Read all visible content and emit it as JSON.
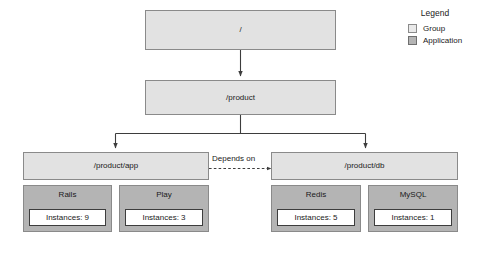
{
  "diagram": {
    "nodes": {
      "root": {
        "label": "/",
        "kind": "Group"
      },
      "product": {
        "label": "/product",
        "kind": "Group"
      },
      "product_app": {
        "label": "/product/app",
        "kind": "Group"
      },
      "product_db": {
        "label": "/product/db",
        "kind": "Group"
      }
    },
    "applications": [
      {
        "name": "Rails",
        "instances_label": "Instances: 9",
        "instances": 9,
        "parent": "/product/app"
      },
      {
        "name": "Play",
        "instances_label": "Instances: 3",
        "instances": 3,
        "parent": "/product/app"
      },
      {
        "name": "Redis",
        "instances_label": "Instances: 5",
        "instances": 5,
        "parent": "/product/db"
      },
      {
        "name": "MySQL",
        "instances_label": "Instances: 1",
        "instances": 1,
        "parent": "/product/db"
      }
    ],
    "edges": {
      "depends_on_label": "Depends on"
    }
  },
  "legend": {
    "title": "Legend",
    "items": [
      {
        "label": "Group",
        "color": "#e9e9e9"
      },
      {
        "label": "Application",
        "color": "#b4b4b4"
      }
    ]
  },
  "colors": {
    "group_fill": "#e2e2e2",
    "app_fill": "#b4b4b4",
    "instances_fill": "#ffffff",
    "border": "#8a8a8a",
    "line": "#3d3d3d",
    "text": "#1a1a1a",
    "background": "#ffffff"
  }
}
